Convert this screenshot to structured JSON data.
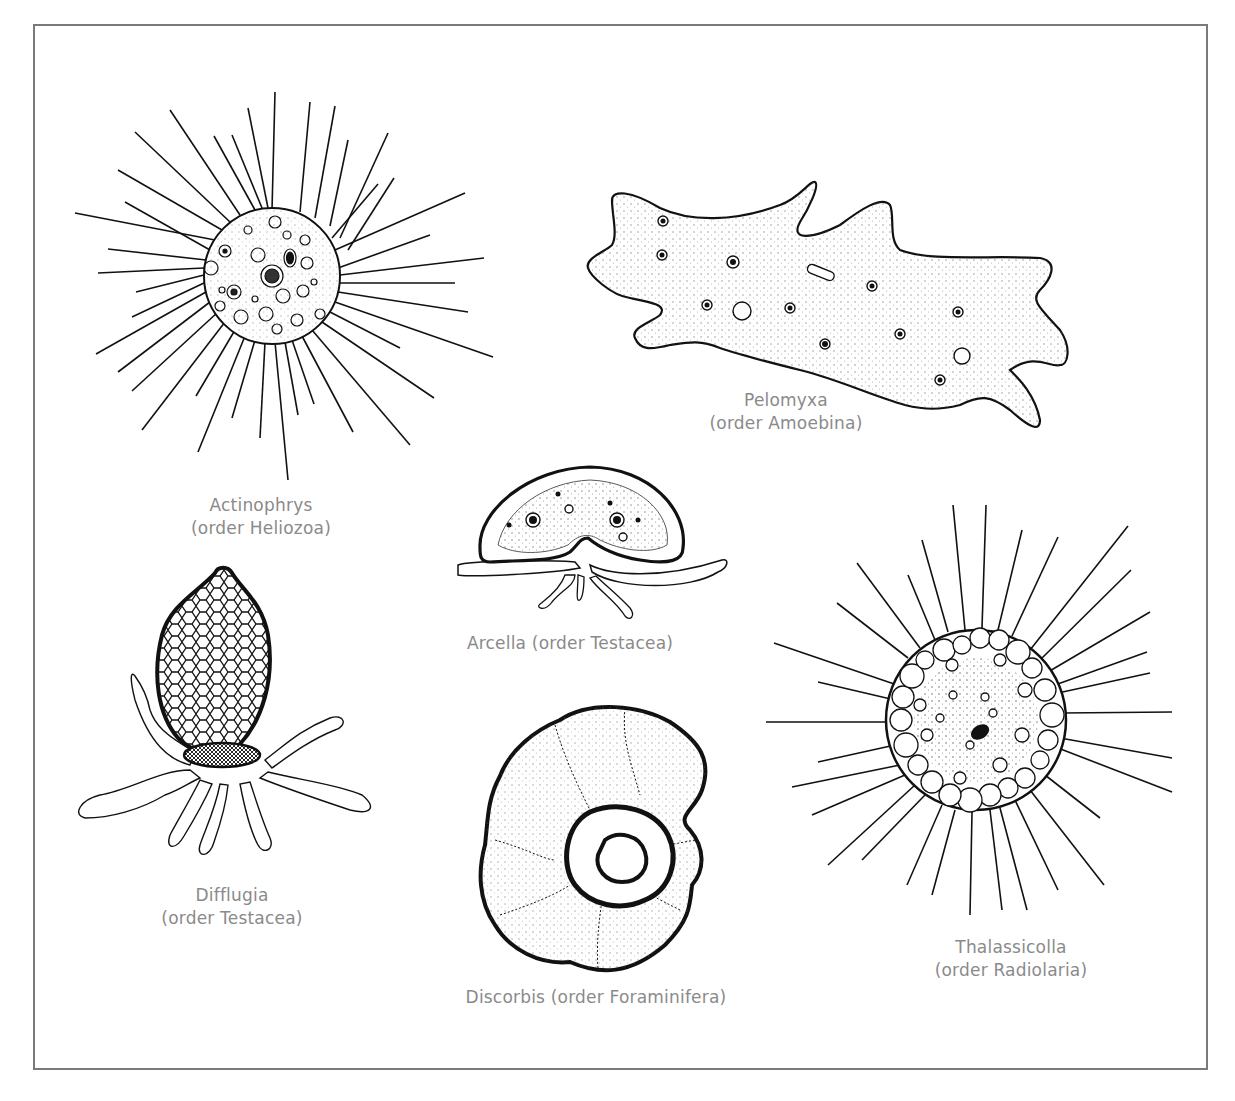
{
  "figure": {
    "frame_color": "#7a7a7a",
    "label_color": "#8a8a8a",
    "organisms": [
      {
        "id": "actinophrys",
        "name": "Actinophrys",
        "order": "(order Heliozoa)"
      },
      {
        "id": "pelomyxa",
        "name": "Pelomyxa",
        "order": "(order Amoebina)"
      },
      {
        "id": "arcella",
        "name": "Arcella (order Testacea)",
        "order": ""
      },
      {
        "id": "difflugia",
        "name": "Difflugia",
        "order": "(order Testacea)"
      },
      {
        "id": "discorbis",
        "name": "Discorbis (order Foraminifera)",
        "order": ""
      },
      {
        "id": "thalassicolla",
        "name": "Thalassicolla",
        "order": "(order Radiolaria)"
      }
    ]
  }
}
